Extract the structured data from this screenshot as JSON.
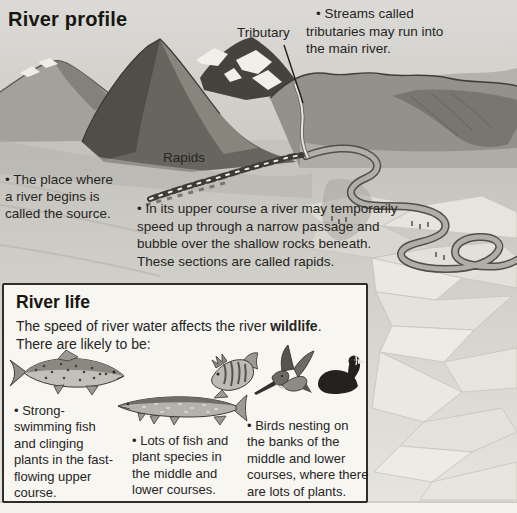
{
  "title": "River profile",
  "labels": {
    "tributary": "Tributary",
    "rapids": "Rapids"
  },
  "notes": {
    "tributaries": "• Streams called\ntributaries may run into\nthe main river.",
    "source": "• The place where\na river begins is\ncalled the source.",
    "upper_course": "• In its upper course a river may temporarily\nspeed up through a narrow passage and\nbubble over the shallow rocks beneath.\nThese sections are called rapids."
  },
  "river_life": {
    "heading": "River life",
    "intro": {
      "pre": "The speed of river water affects the river ",
      "bold": "wildlife",
      "post": "."
    },
    "intro_line2": "There are likely to be:",
    "bullets": {
      "upper": "• Strong-\nswimming fish\nand clinging\nplants in the fast-\nflowing upper\ncourse.",
      "middle": "• Lots of fish and\nplant species in\nthe middle and\nlower courses.",
      "birds": "• Birds nesting on\nthe banks of the\nmiddle and lower\ncourses, where there\nare lots of plants."
    },
    "animals": [
      "trout",
      "pike",
      "perch",
      "kingfisher",
      "coot"
    ]
  },
  "colors": {
    "text": "#26251f",
    "page_background": "#d6d5d1",
    "box_background": "#f7f6f1",
    "box_border": "#2e2d29",
    "mountain_dark": "#4f4e47",
    "snow": "#f0efe9",
    "river": "#b0afa7"
  }
}
